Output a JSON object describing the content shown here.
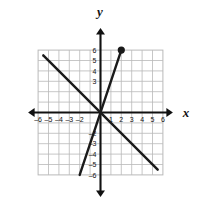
{
  "figure": {
    "kind": "coordinate-plane",
    "background_color": "#ffffff",
    "grid_color": "#b9b9b9",
    "axis_color": "#111111",
    "line_color": "#1a1a1a"
  },
  "axes": {
    "x_label": "x",
    "y_label": "y",
    "x_min": -6,
    "x_max": 6,
    "y_min": -6,
    "y_max": 6,
    "step": 1,
    "x_tick_labels": [
      "-6",
      "-5",
      "-4",
      "-3",
      "-2",
      "1",
      "2",
      "3",
      "4",
      "5",
      "6"
    ],
    "y_tick_labels": [
      "6",
      "5",
      "4",
      "3",
      "-2",
      "-3",
      "-4",
      "-5",
      "-6"
    ],
    "x_tick_values": [
      -6,
      -5,
      -4,
      -3,
      -2,
      1,
      2,
      3,
      4,
      5,
      6
    ],
    "y_tick_values": [
      6,
      5,
      4,
      3,
      -2,
      -3,
      -4,
      -5,
      -6
    ]
  },
  "chart_data": {
    "type": "line",
    "title": "",
    "xlabel": "x",
    "ylabel": "y",
    "xlim": [
      -6,
      6
    ],
    "ylim": [
      -6,
      6
    ],
    "grid": true,
    "legend": "none",
    "series": [
      {
        "name": "rising-line",
        "slope": 3,
        "intercept": 0,
        "equation": "y = 3x",
        "x": [
          -2,
          2
        ],
        "values": [
          -6,
          6
        ],
        "endpoint_dot": {
          "x": 2,
          "y": 6,
          "filled": true
        }
      },
      {
        "name": "falling-line",
        "slope": -1,
        "intercept": 0,
        "equation": "y = -x",
        "x": [
          -5.5,
          5.5
        ],
        "values": [
          5.5,
          -5.5
        ],
        "endpoint_dot": null
      }
    ],
    "intersection": {
      "x": 0,
      "y": 0
    }
  }
}
